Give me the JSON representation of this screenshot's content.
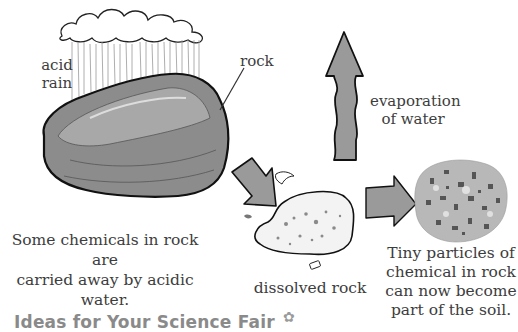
{
  "labels": {
    "acid_rain_line1": "acid",
    "acid_rain_line2": "rain",
    "rock": "rock",
    "evaporation_line1": "evaporation",
    "evaporation_line2": "of water",
    "dissolved_rock": "dissolved rock"
  },
  "captions": {
    "left_line1": "Some chemicals in rock are",
    "left_line2": "carried away by acidic water.",
    "right_line1": "Tiny particles of",
    "right_line2": "chemical in rock",
    "right_line3": "can now become",
    "right_line4": "part of the soil."
  },
  "footer": {
    "title": "Ideas for Your Science Fair",
    "icon": "flower-icon"
  },
  "colors": {
    "arrow_fill": "#9a9a9a",
    "rock_fill": "#8c8c8c",
    "outline": "#111111",
    "footer_text": "#8a8a8a"
  }
}
